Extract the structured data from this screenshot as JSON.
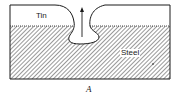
{
  "figure": {
    "caption": "A",
    "labels": {
      "tin": "Tin",
      "steel": "Steel"
    },
    "colors": {
      "line": "#1a1a1a",
      "hatch": "#444444",
      "background": "#ffffff"
    },
    "arrow": "up-arrow"
  }
}
